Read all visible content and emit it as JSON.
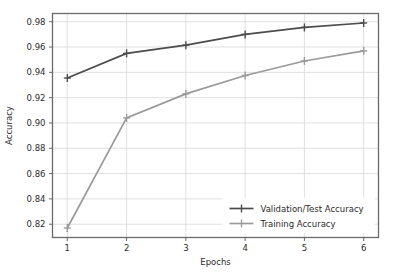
{
  "chart_data": {
    "type": "line",
    "title": "",
    "xlabel": "Epochs",
    "ylabel": "Accuracy",
    "x": [
      1,
      2,
      3,
      4,
      5,
      6
    ],
    "xticklabels": [
      "1",
      "2",
      "3",
      "4",
      "5",
      "6"
    ],
    "yticklabels": [
      "0.82",
      "0.84",
      "0.86",
      "0.88",
      "0.90",
      "0.92",
      "0.94",
      "0.96",
      "0.98"
    ],
    "yticks": [
      0.82,
      0.84,
      0.86,
      0.88,
      0.9,
      0.92,
      0.94,
      0.96,
      0.98
    ],
    "xlim": [
      0.75,
      6.25
    ],
    "ylim": [
      0.8095,
      0.9865
    ],
    "grid": true,
    "legend_position": "lower right",
    "series": [
      {
        "name": "Validation/Test Accuracy",
        "color": "#4c4c4c",
        "marker": "plus",
        "values": [
          0.9355,
          0.955,
          0.9615,
          0.97,
          0.9755,
          0.979
        ]
      },
      {
        "name": "Training Accuracy",
        "color": "#9a9a9a",
        "marker": "plus",
        "values": [
          0.817,
          0.904,
          0.923,
          0.9375,
          0.949,
          0.957
        ]
      }
    ]
  },
  "style": {
    "background": "#ffffff",
    "grid_color": "#d8d8d8",
    "axis_color": "#6a6a6a",
    "text_color": "#2b2b2b"
  }
}
